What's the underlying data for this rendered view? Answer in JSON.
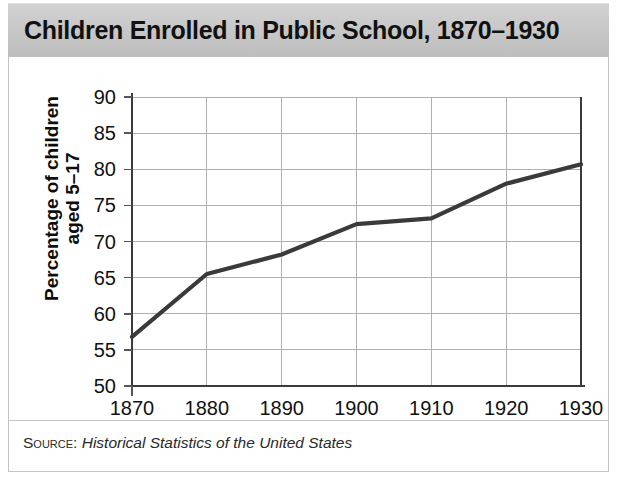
{
  "title": "Children Enrolled in Public School, 1870–1930",
  "source": {
    "label": "Source:",
    "text": "Historical Statistics of the United States"
  },
  "axis": {
    "y_title": "Percentage of children\naged 5–17"
  },
  "chart_data": {
    "type": "line",
    "title": "Children Enrolled in Public School, 1870–1930",
    "xlabel": "",
    "ylabel": "Percentage of children aged 5-17",
    "x": [
      1870,
      1880,
      1890,
      1900,
      1910,
      1920,
      1930
    ],
    "values": [
      56.8,
      65.5,
      68.2,
      72.4,
      73.2,
      78.0,
      80.7
    ],
    "categories": [
      "1870",
      "1880",
      "1890",
      "1900",
      "1910",
      "1920",
      "1930"
    ],
    "xtick_labels": [
      "1870",
      "1880",
      "1890",
      "1900",
      "1910",
      "1920",
      "1930"
    ],
    "ytick_labels": [
      "50",
      "55",
      "60",
      "65",
      "70",
      "75",
      "80",
      "85",
      "90"
    ],
    "yticks": [
      50,
      55,
      60,
      65,
      70,
      75,
      80,
      85,
      90
    ],
    "xlim": [
      1870,
      1930
    ],
    "ylim": [
      50,
      90
    ],
    "grid": true,
    "legend": "none",
    "line_color": "#3a3a3a",
    "series": [
      {
        "name": "Percentage of children aged 5-17 enrolled in public school",
        "values": [
          56.8,
          65.5,
          68.2,
          72.4,
          73.2,
          78.0,
          80.7
        ]
      }
    ]
  },
  "colors": {
    "title_bar": "#c6c6c6",
    "line": "#3a3a3a",
    "grid": "#b0b0b0",
    "panel_border": "#c4c4c4"
  }
}
